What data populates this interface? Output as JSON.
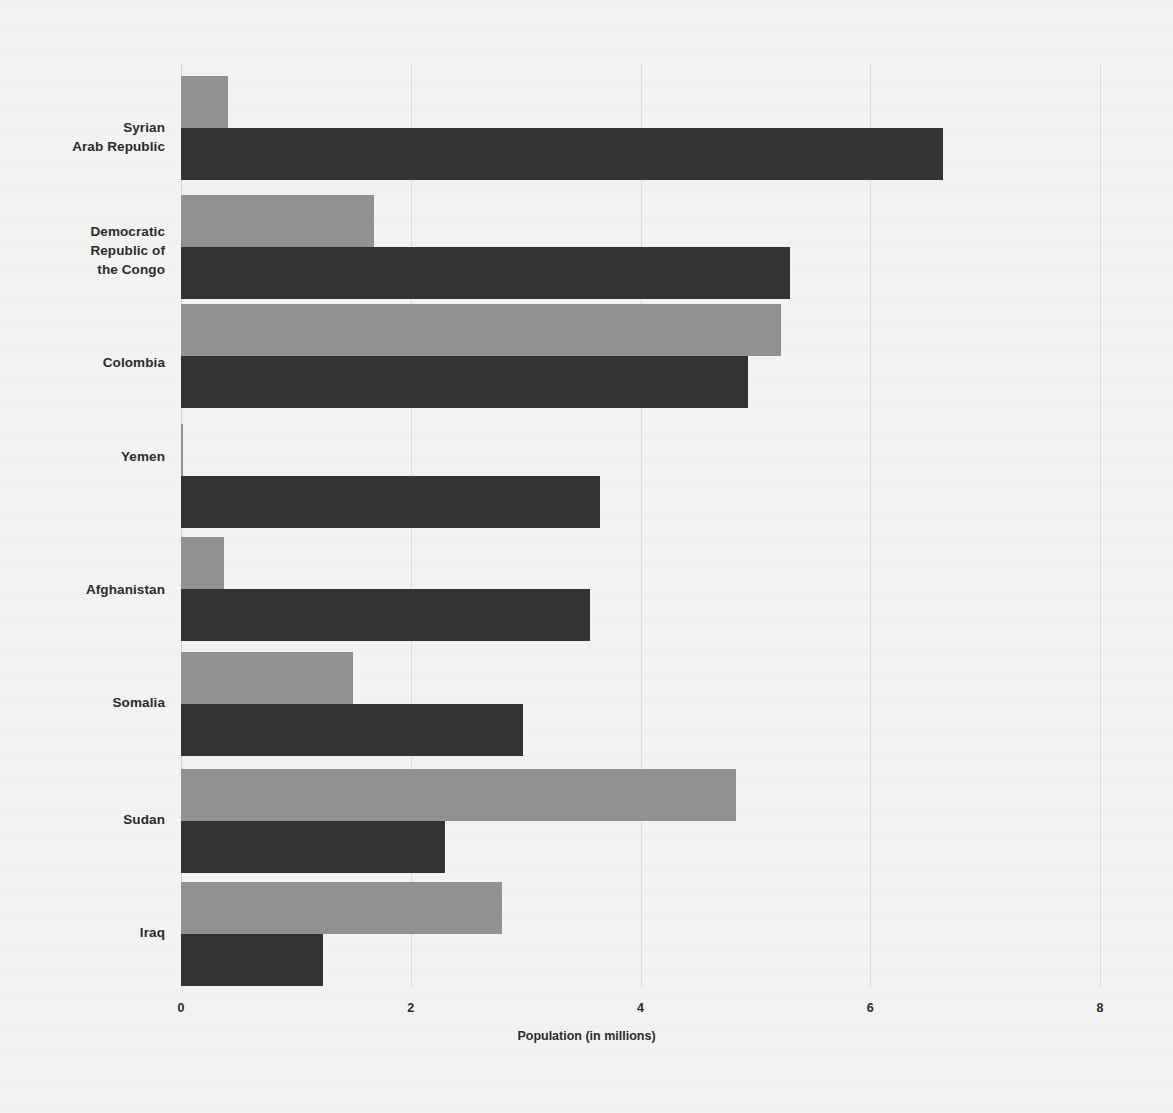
{
  "chart_data": {
    "type": "bar",
    "orientation": "horizontal",
    "title": "",
    "subtitle": "",
    "xlabel": "Population (in millions)",
    "ylabel": "",
    "xlim": [
      0,
      8
    ],
    "xticks": [
      "0",
      "2",
      "4",
      "6",
      "8"
    ],
    "xtick_values": [
      0,
      2,
      4,
      6,
      8
    ],
    "grid": true,
    "grid_axis": "x",
    "legend": false,
    "legend_position": "none",
    "categories": [
      "Syrian\nArab Republic",
      "Democratic\nRepublic of\nthe Congo",
      "Colombia",
      "Yemen",
      "Afghanistan",
      "Somalia",
      "Sudan",
      "Iraq"
    ],
    "series": [
      {
        "name": "series-1",
        "color": "#919191",
        "values": [
          0.41,
          1.68,
          5.22,
          0.02,
          0.37,
          1.5,
          4.83,
          2.79
        ]
      },
      {
        "name": "series-2",
        "color": "#333335",
        "values": [
          6.63,
          5.3,
          4.94,
          3.65,
          3.56,
          2.98,
          2.3,
          1.24
        ]
      }
    ],
    "colors": {
      "series_light": "#919191",
      "series_dark": "#333335",
      "background": "#f2f2f0",
      "gridline": "#dcdcd8",
      "text": "#2b2b2d"
    }
  }
}
